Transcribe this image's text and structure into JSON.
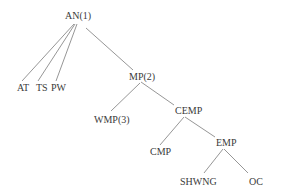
{
  "diagram": {
    "type": "tree",
    "nodes": [
      {
        "id": "AN",
        "label": "AN(1)"
      },
      {
        "id": "AT",
        "label": "AT"
      },
      {
        "id": "TS",
        "label": "TS"
      },
      {
        "id": "PW",
        "label": "PW"
      },
      {
        "id": "MP",
        "label": "MP(2)"
      },
      {
        "id": "WMP",
        "label": "WMP(3)"
      },
      {
        "id": "CEMP",
        "label": "CEMP"
      },
      {
        "id": "CMP",
        "label": "CMP"
      },
      {
        "id": "EMP",
        "label": "EMP"
      },
      {
        "id": "SHWNG",
        "label": "SHWNG"
      },
      {
        "id": "OC",
        "label": "OC"
      }
    ],
    "edges": [
      {
        "from": "AN",
        "to": "AT"
      },
      {
        "from": "AN",
        "to": "TS"
      },
      {
        "from": "AN",
        "to": "PW"
      },
      {
        "from": "AN",
        "to": "MP"
      },
      {
        "from": "MP",
        "to": "WMP"
      },
      {
        "from": "MP",
        "to": "CEMP"
      },
      {
        "from": "CEMP",
        "to": "CMP"
      },
      {
        "from": "CEMP",
        "to": "EMP"
      },
      {
        "from": "EMP",
        "to": "SHWNG"
      },
      {
        "from": "EMP",
        "to": "OC"
      }
    ]
  }
}
